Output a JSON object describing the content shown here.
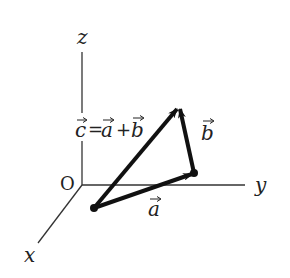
{
  "diagram": {
    "axes": {
      "x_label": "x",
      "y_label": "y",
      "z_label": "z",
      "origin_label": "O"
    },
    "vectors": {
      "a_label": "a",
      "b_label": "b",
      "c_label": "c",
      "equation": {
        "c": "c",
        "eq": "=",
        "a": "a",
        "plus": "+",
        "b": "b"
      }
    },
    "colors": {
      "axis": "#333333",
      "vector": "#111111",
      "text": "#222222",
      "background": "#ffffff"
    }
  }
}
